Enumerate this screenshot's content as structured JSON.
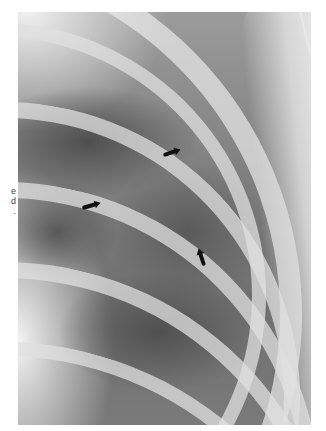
{
  "image": {
    "type": "radiograph",
    "description": "Chest X-ray detail of upper right hemithorax showing ribs and lung fields with three black arrows",
    "arrows": [
      {
        "name": "arrow-upper",
        "direction": "right"
      },
      {
        "name": "arrow-left",
        "direction": "right"
      },
      {
        "name": "arrow-lower",
        "direction": "up"
      }
    ]
  },
  "caption_fragment": {
    "lines": [
      "e",
      "d",
      "."
    ]
  },
  "colors": {
    "background": "#ffffff",
    "arrow": "#111111",
    "bone": "#e1e1e1",
    "lung": "#505050"
  }
}
